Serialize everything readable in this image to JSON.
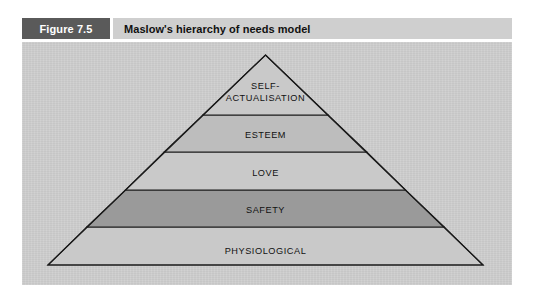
{
  "figure": {
    "number_label": "Figure 7.5",
    "title": "Maslow's hierarchy of needs model"
  },
  "colors": {
    "page_background": "#ffffff",
    "figure_number_box": "#5a5a5a",
    "figure_number_text": "#ffffff",
    "title_bar_background": "#cfcfcf",
    "title_text": "#111111",
    "panel_background": "#cecece",
    "pyramid_outline": "#1a1a1a",
    "tier_divider": "#1a1a1a",
    "tier_fill_default": "#c9c9c9",
    "tier_fill_esteem": "#bdbdbd",
    "tier_fill_safety": "#9a9a9a",
    "tier_label_text": "#111111"
  },
  "diagram": {
    "type": "pyramid",
    "shape": "triangle",
    "apex": {
      "x": 243,
      "y": 15
    },
    "base_left": {
      "x": 26,
      "y": 223
    },
    "base_right": {
      "x": 461,
      "y": 223
    },
    "divider_y": [
      73,
      110,
      148,
      185
    ],
    "tier_count": 5,
    "tiers": [
      {
        "rank": 5,
        "position": "top",
        "label": "SELF-ACTUALISATION",
        "label_lines": [
          "SELF-",
          "ACTUALISATION"
        ],
        "fill": "#c9c9c9",
        "shaded": false,
        "y_top": 15,
        "y_bottom": 73,
        "label_y": [
          45,
          57
        ]
      },
      {
        "rank": 4,
        "position": "upper-middle",
        "label": "ESTEEM",
        "label_lines": [
          "ESTEEM"
        ],
        "fill": "#bdbdbd",
        "shaded": true,
        "y_top": 73,
        "y_bottom": 110,
        "label_y": [
          95
        ]
      },
      {
        "rank": 3,
        "position": "middle",
        "label": "LOVE",
        "label_lines": [
          "LOVE"
        ],
        "fill": "#c9c9c9",
        "shaded": false,
        "y_top": 110,
        "y_bottom": 148,
        "label_y": [
          133
        ]
      },
      {
        "rank": 2,
        "position": "lower-middle",
        "label": "SAFETY",
        "label_lines": [
          "SAFETY"
        ],
        "fill": "#9a9a9a",
        "shaded": true,
        "y_top": 148,
        "y_bottom": 185,
        "label_y": [
          170
        ]
      },
      {
        "rank": 1,
        "position": "base",
        "label": "PHYSIOLOGICAL",
        "label_lines": [
          "PHYSIOLOGICAL"
        ],
        "fill": "#c9c9c9",
        "shaded": false,
        "y_top": 185,
        "y_bottom": 223,
        "label_y": [
          208
        ]
      }
    ]
  }
}
